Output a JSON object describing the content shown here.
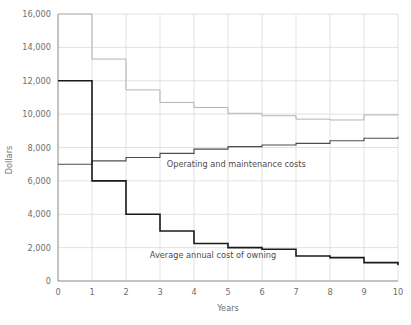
{
  "chart_data": {
    "type": "line",
    "title": "",
    "subtitle": "",
    "xlabel": "Years",
    "ylabel": "Dollars",
    "xlim": [
      0,
      10
    ],
    "ylim": [
      0,
      16000
    ],
    "grid": true,
    "legend_position": "inline-annotations",
    "x_ticks": [
      "0",
      "1",
      "2",
      "3",
      "4",
      "5",
      "6",
      "7",
      "8",
      "9",
      "10"
    ],
    "x_tick_values": [
      0,
      1,
      2,
      3,
      4,
      5,
      6,
      7,
      8,
      9,
      10
    ],
    "y_ticks": [
      "0",
      "2,000",
      "4,000",
      "6,000",
      "8,000",
      "10,000",
      "12,000",
      "14,000",
      "16,000"
    ],
    "y_tick_values": [
      0,
      2000,
      4000,
      6000,
      8000,
      10000,
      12000,
      14000,
      16000
    ],
    "x": [
      0,
      1,
      2,
      3,
      4,
      5,
      6,
      7,
      8,
      9,
      10
    ],
    "series": [
      {
        "name": "Total average annual cost",
        "annotation": "",
        "color": "#b3b3b3",
        "style": "step",
        "linewidth": 1.0,
        "values": [
          19000,
          13300,
          11450,
          10700,
          10400,
          10050,
          9900,
          9700,
          9650,
          9950,
          10000
        ]
      },
      {
        "name": "Operating and maintenance costs",
        "annotation": "Operating and maintenance costs",
        "color": "#4d4d4d",
        "style": "step",
        "linewidth": 1.1,
        "values": [
          7000,
          7200,
          7400,
          7650,
          7900,
          8050,
          8150,
          8250,
          8400,
          8550,
          8650
        ]
      },
      {
        "name": "Average annual cost of owning",
        "annotation": "Average annual cost of owning",
        "color": "#1a1a1a",
        "style": "step",
        "linewidth": 1.6,
        "values": [
          12000,
          6000,
          4000,
          3000,
          2250,
          2000,
          1900,
          1500,
          1400,
          1100,
          950
        ]
      }
    ],
    "annotations": [
      {
        "text": "Operating and maintenance costs",
        "x": 3.2,
        "y": 6850
      },
      {
        "text": "Average annual cost of owning",
        "x": 2.7,
        "y": 1350
      }
    ]
  },
  "colors": {
    "grid": "#d9d9d9",
    "axis": "#8c8c8c",
    "tick_text": "#6e6e6e",
    "annotation_text": "#4d4d4d",
    "background": "#ffffff"
  }
}
